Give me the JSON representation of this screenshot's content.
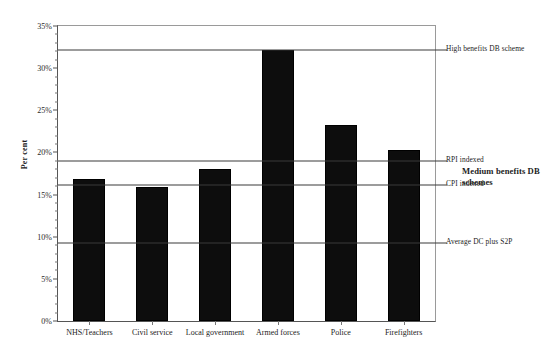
{
  "chart_data": {
    "type": "bar",
    "title": "",
    "xlabel": "",
    "ylabel": "Per cent",
    "categories": [
      "NHS/Teachers",
      "Civil service",
      "Local government",
      "Armed forces",
      "Police",
      "Firefighters"
    ],
    "values": [
      16.8,
      15.9,
      18.0,
      32.2,
      23.3,
      20.3
    ],
    "ylim": [
      0,
      35
    ],
    "ytick_values": [
      0,
      5,
      10,
      15,
      20,
      25,
      30,
      35
    ],
    "ytick_labels": [
      "0%",
      "5%",
      "10%",
      "15%",
      "20%",
      "25%",
      "30%",
      "35%"
    ],
    "ytick_minor_step": 1,
    "grid": false,
    "legend": "none",
    "bar_color": "#0d0d0d",
    "reference_lines": [
      {
        "value": 32.2,
        "label": "High benefits DB scheme",
        "bold": false
      },
      {
        "value": 19.0,
        "label": "RPI indexed",
        "bold": false
      },
      {
        "value": 16.1,
        "label": "CPI indexed",
        "bold": false
      },
      {
        "value": 9.3,
        "label": "Average DC plus S2P",
        "bold": false
      }
    ],
    "annotations": [
      {
        "value": 17.6,
        "label": "Medium benefits DB schemes",
        "bold": true
      }
    ]
  },
  "axis": {
    "y_title": "Per cent"
  },
  "title_remnant": ""
}
